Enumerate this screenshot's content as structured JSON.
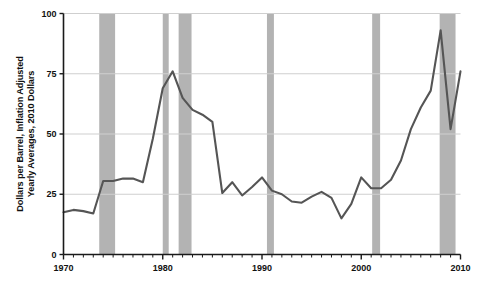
{
  "chart_data": {
    "type": "line",
    "title": "",
    "xlabel": "",
    "ylabel": "Dollars per Barrel, Inflation Adjusted\nYearly Averages, 2010 Dollars",
    "ylabel_line1": "Dollars per Barrel, Inflation Adjusted",
    "ylabel_line2": "Yearly Averages, 2010 Dollars",
    "xlim": [
      1970,
      2010
    ],
    "ylim": [
      0,
      100
    ],
    "grid": true,
    "legend": "none",
    "x_tick_labels": [
      "1970",
      "1980",
      "1990",
      "2000",
      "2010"
    ],
    "x_tick_values": [
      1970,
      1980,
      1990,
      2000,
      2010
    ],
    "x_minor_tick_interval": 1,
    "y_tick_labels": [
      "0",
      "25",
      "50",
      "75",
      "100"
    ],
    "y_tick_values": [
      0,
      25,
      50,
      75,
      100
    ],
    "series": [
      {
        "name": "Crude oil price",
        "color": "#555555",
        "x": [
          1970,
          1971,
          1972,
          1973,
          1974,
          1975,
          1976,
          1977,
          1978,
          1979,
          1980,
          1981,
          1982,
          1983,
          1984,
          1985,
          1986,
          1987,
          1988,
          1989,
          1990,
          1991,
          1992,
          1993,
          1994,
          1995,
          1996,
          1997,
          1998,
          1999,
          2000,
          2001,
          2002,
          2003,
          2004,
          2005,
          2006,
          2007,
          2008,
          2009,
          2010
        ],
        "values": [
          17.5,
          18.5,
          18.0,
          17.0,
          30.5,
          30.5,
          31.5,
          31.5,
          30.0,
          48.0,
          69.0,
          76.0,
          65.0,
          60.0,
          58.0,
          55.0,
          25.5,
          30.0,
          24.5,
          28.0,
          32.0,
          26.5,
          25.0,
          22.0,
          21.5,
          24.0,
          26.0,
          23.5,
          15.0,
          21.0,
          32.0,
          27.5,
          27.5,
          31.0,
          39.0,
          52.0,
          61.0,
          68.0,
          93.0,
          52.0,
          76.0
        ]
      }
    ],
    "shaded_bands": {
      "name": "Recession periods",
      "color": "#b3b3b3",
      "ranges": [
        {
          "start": 1973.6,
          "end": 1975.2
        },
        {
          "start": 1980.0,
          "end": 1980.6
        },
        {
          "start": 1981.6,
          "end": 1982.9
        },
        {
          "start": 1990.5,
          "end": 1991.2
        },
        {
          "start": 2001.1,
          "end": 2001.9
        },
        {
          "start": 2007.9,
          "end": 2009.5
        }
      ]
    },
    "colors": {
      "line": "#555555",
      "band": "#b3b3b3",
      "grid": "#cfcfcf",
      "axis": "#1a1a1a",
      "text": "#111111",
      "background": "#ffffff"
    }
  }
}
